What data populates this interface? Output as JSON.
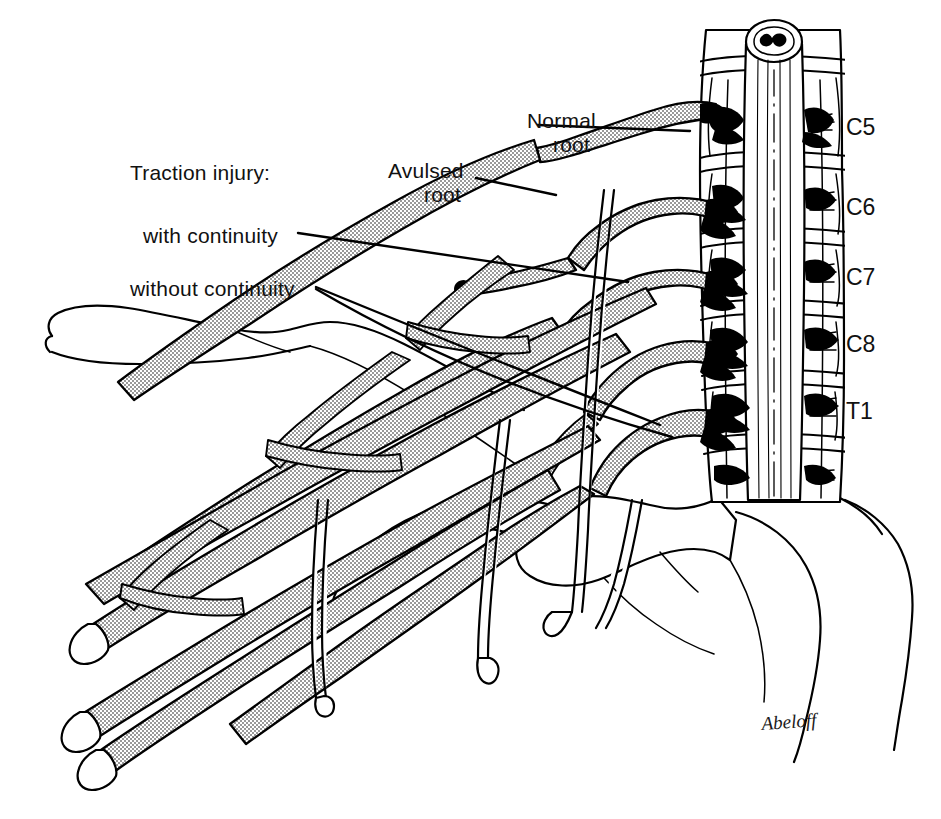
{
  "figure": {
    "background_color": "#ffffff",
    "ink_color": "#000000",
    "width": 941,
    "height": 819
  },
  "annotations": {
    "traction_heading": "Traction injury:",
    "with_continuity": "with continuity",
    "without_continuity": "without continuity",
    "normal_root_line1": "Normal",
    "normal_root_line2": "root",
    "avulsed_root_line1": "Avulsed",
    "avulsed_root_line2": "root"
  },
  "vertebral_levels": [
    {
      "label": "C5",
      "x": 846,
      "y": 135
    },
    {
      "label": "C6",
      "x": 846,
      "y": 215
    },
    {
      "label": "C7",
      "x": 846,
      "y": 285
    },
    {
      "label": "C8",
      "x": 846,
      "y": 352
    },
    {
      "label": "T1",
      "x": 846,
      "y": 419
    }
  ],
  "signature": "Abeloff"
}
